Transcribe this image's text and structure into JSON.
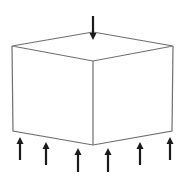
{
  "diagram": {
    "title": "Cube under compressive load",
    "colors": {
      "edge": "#6e6e6e",
      "arrow": "#1a1a1a",
      "background": "#ffffff"
    },
    "cube": {
      "vertices": {
        "top_left": [
          12,
          46
        ],
        "top_back": [
          93,
          32
        ],
        "top_right": [
          173,
          46
        ],
        "top_front": [
          93,
          61
        ],
        "bottom_left": [
          13,
          131
        ],
        "bottom_front": [
          93,
          145
        ],
        "bottom_right": [
          172,
          131
        ]
      }
    },
    "top_arrow": {
      "x": 93,
      "tail_y": 16,
      "tip_y": 40,
      "direction": "down"
    },
    "bottom_arrows": [
      {
        "x": 20,
        "tail_y": 160,
        "tip_y": 137,
        "direction": "up"
      },
      {
        "x": 46,
        "tail_y": 165,
        "tip_y": 142,
        "direction": "up"
      },
      {
        "x": 78,
        "tail_y": 172,
        "tip_y": 148,
        "direction": "up"
      },
      {
        "x": 108,
        "tail_y": 172,
        "tip_y": 148,
        "direction": "up"
      },
      {
        "x": 140,
        "tail_y": 165,
        "tip_y": 142,
        "direction": "up"
      },
      {
        "x": 170,
        "tail_y": 160,
        "tip_y": 137,
        "direction": "up"
      }
    ]
  }
}
